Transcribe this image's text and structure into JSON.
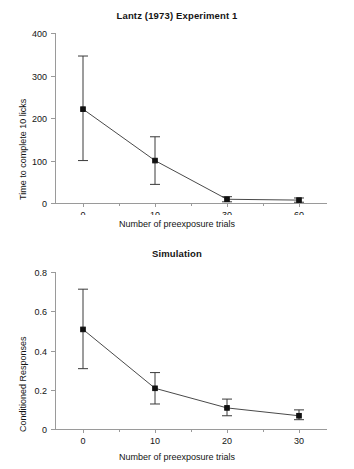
{
  "figure": {
    "background": "#ffffff",
    "axis_color": "#9a9a9a",
    "line_color": "#4a4a4a",
    "marker_color": "#111111"
  },
  "panels": {
    "top": {
      "title": "Lantz (1973) Experiment 1",
      "xlabel": "Number of preexposure trials",
      "ylabel": "Time to complete 10 licks"
    },
    "bottom": {
      "title": "Simulation",
      "xlabel": "Number of preexposure trials",
      "ylabel": "Conditioned Responses"
    }
  },
  "chart_data": [
    {
      "type": "line",
      "title": "Lantz (1973) Experiment 1",
      "xlabel": "Number of preexposure trials",
      "ylabel": "Time to complete 10 licks",
      "categories": [
        "0",
        "10",
        "30",
        "60"
      ],
      "xticklabels": [
        "0",
        "10",
        "30",
        "60"
      ],
      "yticklabels": [
        "0",
        "100",
        "200",
        "300",
        "400"
      ],
      "yticks": [
        0,
        100,
        200,
        300,
        400
      ],
      "ylim": [
        0,
        400
      ],
      "grid": false,
      "legend": false,
      "series": [
        {
          "name": "Time to complete 10 licks",
          "values": [
            222,
            101,
            10,
            8
          ],
          "err_low": [
            101,
            45,
            4,
            3
          ],
          "err_high": [
            347,
            157,
            16,
            13
          ],
          "marker": "square"
        }
      ]
    },
    {
      "type": "line",
      "title": "Simulation",
      "xlabel": "Number of preexposure trials",
      "ylabel": "Conditioned Responses",
      "categories": [
        "0",
        "10",
        "20",
        "30"
      ],
      "xticklabels": [
        "0",
        "10",
        "20",
        "30"
      ],
      "yticklabels": [
        "0",
        "0.2",
        "0.4",
        "0.6",
        "0.8"
      ],
      "yticks": [
        0,
        0.2,
        0.4,
        0.6,
        0.8
      ],
      "ylim": [
        0,
        0.8
      ],
      "grid": false,
      "legend": false,
      "series": [
        {
          "name": "Conditioned Responses",
          "values": [
            0.51,
            0.21,
            0.11,
            0.07
          ],
          "err_low": [
            0.31,
            0.13,
            0.07,
            0.05
          ],
          "err_high": [
            0.715,
            0.29,
            0.155,
            0.1
          ],
          "marker": "square"
        }
      ]
    }
  ]
}
